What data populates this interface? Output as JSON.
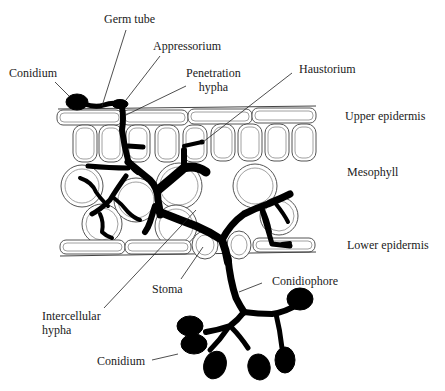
{
  "diagram": {
    "labels": {
      "germ_tube": "Germ  tube",
      "appressorium": "Appressorium",
      "conidium_top": "Conidium",
      "penetration_hypha": "Penetration\nhypha",
      "haustorium": "Haustorium",
      "upper_epidermis": "Upper  epidermis",
      "mesophyll": "Mesophyll",
      "lower_epidermis": "Lower  epidermis",
      "stoma": "Stoma",
      "conidiophore": "Conidiophore",
      "intercellular_hypha": "Intercellular\nhypha",
      "conidium_bottom": "Conidium"
    },
    "colors": {
      "fungus": "#000000",
      "cell_outline": "#555555",
      "background": "#ffffff",
      "text": "#1a1a1a"
    }
  }
}
